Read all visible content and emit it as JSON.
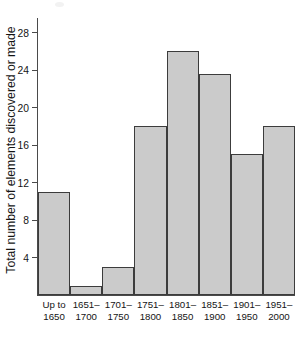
{
  "chart_data": {
    "type": "bar",
    "title": "",
    "subtitle": "",
    "xlabel": "",
    "ylabel": "Total number of elements discovered or made",
    "categories": [
      "Up to 1650",
      "1651-1700",
      "1701-1750",
      "1751-1800",
      "1801-1850",
      "1851-1900",
      "1901-1950",
      "1951-2000"
    ],
    "category_lines": [
      [
        "Up to",
        "1650"
      ],
      [
        "1651–",
        "1700"
      ],
      [
        "1701–",
        "1750"
      ],
      [
        "1751–",
        "1800"
      ],
      [
        "1801–",
        "1850"
      ],
      [
        "1851–",
        "1900"
      ],
      [
        "1901–",
        "1950"
      ],
      [
        "1951–",
        "2000"
      ]
    ],
    "values": [
      11,
      1,
      3,
      18,
      26,
      23.5,
      15,
      18
    ],
    "ylim": [
      0,
      29.5
    ],
    "yticks": [
      4,
      8,
      12,
      16,
      20,
      24,
      28
    ],
    "ytick_labels": [
      "4",
      "8",
      "12",
      "16",
      "20",
      "24",
      "28"
    ],
    "grid": false,
    "legend": false,
    "legend_position": "none",
    "bar_fill_color": "#cbcbcb",
    "bar_border_color": "#3c3c3c",
    "axis_color": "#4a4a4a",
    "background_color": "#ffffff",
    "text_color": "#141414"
  }
}
